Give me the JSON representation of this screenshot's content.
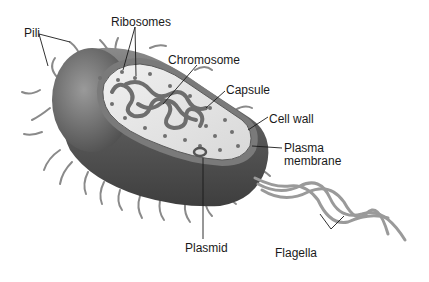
{
  "diagram": {
    "type": "labeled-illustration",
    "color_scheme": {
      "background": "#ffffff",
      "capsule": "#5c5c5c",
      "cell_wall": "#7a7a7a",
      "cytoplasm": "#e6e6e6",
      "chromosome": "#6e6e6e",
      "ribosome": "#707070",
      "appendage": "#8a8a8a",
      "leader_line": "#1a1a1a",
      "label_text": "#1a1a1a"
    },
    "labels": [
      {
        "id": "pili",
        "text": "Pili"
      },
      {
        "id": "ribosomes",
        "text": "Ribosomes"
      },
      {
        "id": "chromosome",
        "text": "Chromosome"
      },
      {
        "id": "capsule",
        "text": "Capsule"
      },
      {
        "id": "cell_wall",
        "text": "Cell wall"
      },
      {
        "id": "plasma_membrane_1",
        "text": "Plasma"
      },
      {
        "id": "plasma_membrane_2",
        "text": "membrane"
      },
      {
        "id": "plasmid",
        "text": "Plasmid"
      },
      {
        "id": "flagella",
        "text": "Flagella"
      }
    ]
  }
}
